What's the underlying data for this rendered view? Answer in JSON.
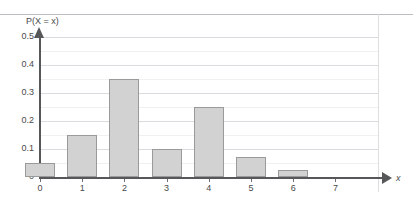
{
  "chart_data": {
    "type": "bar",
    "title": "",
    "subtitle": "",
    "xlabel": "x",
    "ylabel": "P(X = x)",
    "categories": [
      "0",
      "1",
      "2",
      "3",
      "4",
      "5",
      "6",
      "7"
    ],
    "values": [
      0.05,
      0.15,
      0.35,
      0.1,
      0.25,
      0.07,
      0.025,
      0
    ],
    "series": [
      {
        "name": "P(X = x)",
        "values": [
          0.05,
          0.15,
          0.35,
          0.1,
          0.25,
          0.07,
          0.025,
          0
        ]
      }
    ],
    "xlim": [
      -0.6,
      7.8
    ],
    "ylim": [
      0,
      0.5
    ],
    "y_major_ticks": [
      0,
      0.1,
      0.2,
      0.3,
      0.4,
      0.5
    ],
    "y_major_tick_labels": [
      "0",
      "0.1",
      "0.2",
      "0.3",
      "0.4",
      "0.5"
    ],
    "y_minor_ticks": [
      0.05,
      0.15,
      0.25,
      0.35,
      0.45
    ],
    "grid": true,
    "legend": false,
    "legend_position": "none",
    "bar_fill_color": "#d2d2d2",
    "bar_edge_color": "#9a9a9a",
    "axis_color": "#555759",
    "major_grid_color": "#d9dcde",
    "minor_grid_color": "#eef0f1",
    "background_color": "#ffffff",
    "annotations": []
  }
}
